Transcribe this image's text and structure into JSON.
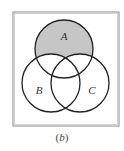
{
  "diagram": {
    "type": "venn",
    "caption": {
      "open": "(",
      "letter": "b",
      "close": ")"
    },
    "universe": {
      "x": 13,
      "y": 12,
      "width": 106,
      "height": 114,
      "stroke": "#8a8a8a"
    },
    "sets": [
      {
        "label": "A",
        "cx": 64,
        "cy": 49,
        "r": 29,
        "label_x": 64,
        "label_y": 40
      },
      {
        "label": "B",
        "cx": 51,
        "cy": 83,
        "r": 29,
        "label_x": 39,
        "label_y": 94
      },
      {
        "label": "C",
        "cx": 80,
        "cy": 83,
        "r": 29,
        "label_x": 92,
        "label_y": 94
      }
    ],
    "shaded_region": "A minus (B union C)",
    "colors": {
      "shade": "#c6c6c6",
      "circle_stroke": "#222222",
      "background": "#ffffff"
    }
  }
}
